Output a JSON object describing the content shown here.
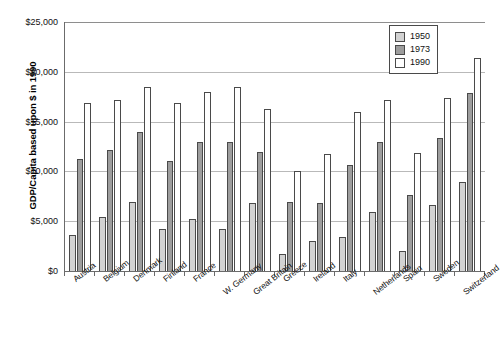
{
  "chart_data": {
    "type": "bar",
    "title": "",
    "xlabel": "",
    "ylabel": "GDP/Capita based upon $ in 1990",
    "ylim": [
      0,
      25000
    ],
    "ytick_values": [
      0,
      5000,
      10000,
      15000,
      20000,
      25000
    ],
    "ytick_labels": [
      "$0",
      "$5,000",
      "$10,000",
      "$15,000",
      "$20,000",
      "$25,000"
    ],
    "grid": true,
    "legend_position": "top-right",
    "categories": [
      "Austria",
      "Belgium",
      "Denmark",
      "Finland",
      "France",
      "W. Germany",
      "Great Britain",
      "Greece",
      "Ireland",
      "Italy",
      "Netherlands",
      "Spain",
      "Sweden",
      "Switzerland"
    ],
    "series": [
      {
        "name": "1950",
        "color": "#d2d2d2",
        "values": [
          3600,
          5400,
          6900,
          4200,
          5200,
          4200,
          6800,
          1700,
          3000,
          3400,
          5900,
          2000,
          6600,
          8900
        ]
      },
      {
        "name": "1973",
        "color": "#9d9d9d",
        "values": [
          11200,
          12100,
          14000,
          11000,
          13000,
          13000,
          11900,
          6900,
          6800,
          10600,
          13000,
          7600,
          13400,
          17900
        ]
      },
      {
        "name": "1990",
        "color": "#ffffff",
        "values": [
          16900,
          17200,
          18500,
          16900,
          18000,
          18500,
          16300,
          10000,
          11700,
          16000,
          17200,
          11800,
          17400,
          21400
        ]
      }
    ]
  },
  "legend": {
    "items": [
      {
        "label": "1950",
        "swatch_class": "s1950"
      },
      {
        "label": "1973",
        "swatch_class": "s1973"
      },
      {
        "label": "1990",
        "swatch_class": "s1990"
      }
    ]
  },
  "colors": {
    "series_1950": "#d2d2d2",
    "series_1973": "#9d9d9d",
    "series_1990": "#ffffff",
    "axis": "#6b6b6b",
    "gridline": "#b9b9b9",
    "bar_outline": "#4a4a4a",
    "background": "#ffffff"
  }
}
